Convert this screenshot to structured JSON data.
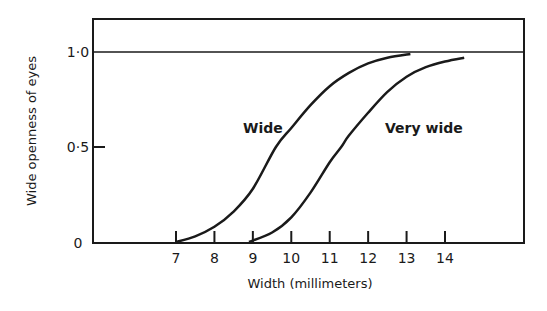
{
  "chart_data": {
    "type": "line",
    "title": "",
    "xlabel": "Width (millimeters)",
    "ylabel": "Wide openness of eyes",
    "xlim": [
      7,
      14
    ],
    "ylim": [
      0,
      1.0
    ],
    "x_ticks": [
      "7",
      "8",
      "9",
      "10",
      "11",
      "12",
      "13",
      "14"
    ],
    "y_ticks": [
      "0",
      "0·5",
      "1·0"
    ],
    "grid": false,
    "legend": "none (curves labeled directly)",
    "reference_line": {
      "y": 1.0,
      "style": "horizontal line across plot"
    },
    "series": [
      {
        "name": "Wide",
        "x": [
          7.0,
          7.5,
          8.0,
          8.5,
          9.0,
          9.6,
          10.0,
          10.5,
          11.0,
          11.5,
          12.0,
          12.5,
          13.1
        ],
        "y": [
          0.0,
          0.03,
          0.08,
          0.16,
          0.28,
          0.5,
          0.6,
          0.72,
          0.82,
          0.89,
          0.94,
          0.97,
          0.99
        ]
      },
      {
        "name": "Very wide",
        "x": [
          8.9,
          9.5,
          10.0,
          10.5,
          11.0,
          11.3,
          11.5,
          12.0,
          12.5,
          13.0,
          13.5,
          14.0,
          14.5
        ],
        "y": [
          0.0,
          0.05,
          0.13,
          0.26,
          0.42,
          0.5,
          0.56,
          0.68,
          0.79,
          0.87,
          0.92,
          0.95,
          0.97
        ]
      }
    ]
  },
  "labels": {
    "xlabel": "Width (millimeters)",
    "ylabel": "Wide openness of eyes",
    "series_wide": "Wide",
    "series_very_wide": "Very wide",
    "y_tick_0": "0",
    "y_tick_05": "0·5",
    "y_tick_10": "1·0",
    "x_ticks": [
      "7",
      "8",
      "9",
      "10",
      "11",
      "12",
      "13",
      "14"
    ]
  }
}
